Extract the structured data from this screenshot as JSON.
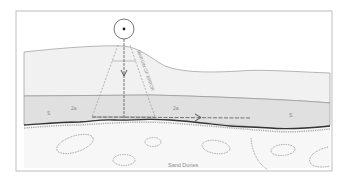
{
  "diagram": {
    "title": "",
    "labels": {
      "margin": "MARGIN OF ERROR",
      "sand_dunes": "Sand Dunes",
      "layer_s_left": "S",
      "layer_2a_left": "2a",
      "layer_2a_right": "2a",
      "layer_s_right": "S"
    },
    "colors": {
      "frame": "#bdbdbd",
      "upper_layer": "#f1f1f1",
      "middle_layer": "#e0e0e0",
      "sand": "#f7f7f7",
      "line": "#777777",
      "dark_line": "#333333"
    },
    "icons": {
      "sensor": "sensor-circle-icon",
      "down_arrow": "arrow-down-icon",
      "right_arrow": "arrow-right-icon"
    }
  }
}
